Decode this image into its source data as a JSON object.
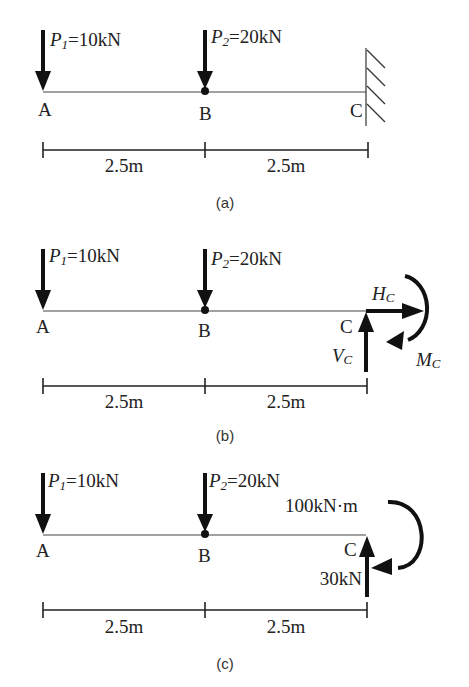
{
  "panels": [
    {
      "id": "a",
      "caption": "(a)",
      "loads": {
        "p1": {
          "sym": "P",
          "sub": "1",
          "value": "=10kN"
        },
        "p2": {
          "sym": "P",
          "sub": "2",
          "value": "=20kN"
        }
      },
      "points": {
        "a": "A",
        "b": "B",
        "c": "C"
      },
      "support": "fixed-wall",
      "dimensions": [
        "2.5m",
        "2.5m"
      ]
    },
    {
      "id": "b",
      "caption": "(b)",
      "loads": {
        "p1": {
          "sym": "P",
          "sub": "1",
          "value": "=10kN"
        },
        "p2": {
          "sym": "P",
          "sub": "2",
          "value": "=20kN"
        }
      },
      "points": {
        "a": "A",
        "b": "B",
        "c": "C"
      },
      "reactions": {
        "h": {
          "sym": "H",
          "sub": "C"
        },
        "v": {
          "sym": "V",
          "sub": "C"
        },
        "m": {
          "sym": "M",
          "sub": "C"
        }
      },
      "dimensions": [
        "2.5m",
        "2.5m"
      ]
    },
    {
      "id": "c",
      "caption": "(c)",
      "loads": {
        "p1": {
          "sym": "P",
          "sub": "1",
          "value": "=10kN"
        },
        "p2": {
          "sym": "P",
          "sub": "2",
          "value": "=20kN"
        }
      },
      "points": {
        "a": "A",
        "b": "B",
        "c": "C"
      },
      "reactions": {
        "moment": "100kN·m",
        "vertical": "30kN"
      },
      "dimensions": [
        "2.5m",
        "2.5m"
      ]
    }
  ]
}
